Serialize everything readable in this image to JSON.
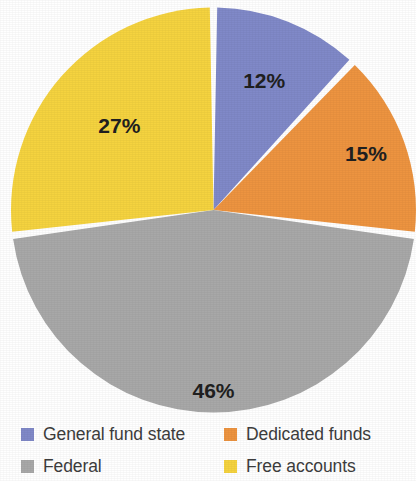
{
  "chart_data": {
    "type": "pie",
    "title": "",
    "subtitle": "",
    "xlabel": "",
    "ylabel": "",
    "legend_position": "bottom",
    "grid": false,
    "start_angle_deg": 0,
    "direction": "clockwise",
    "categories": [
      "General fund state",
      "Dedicated funds",
      "Federal",
      "Free accounts"
    ],
    "values": [
      12,
      15,
      46,
      27
    ],
    "value_unit": "%",
    "data_labels": [
      "12%",
      "15%",
      "46%",
      "27%"
    ],
    "colors": [
      "#8089c8",
      "#ed9440",
      "#a8a8a8",
      "#f5d33f"
    ],
    "slices": [
      {
        "label": "General fund state",
        "value": 12,
        "data_label": "12%",
        "color": "#8089c8",
        "start_deg": 0.0,
        "end_deg": 43.2
      },
      {
        "label": "Dedicated funds",
        "value": 15,
        "data_label": "15%",
        "color": "#ed9440",
        "start_deg": 43.2,
        "end_deg": 97.2
      },
      {
        "label": "Federal",
        "value": 46,
        "data_label": "46%",
        "color": "#a8a8a8",
        "start_deg": 97.2,
        "end_deg": 262.8
      },
      {
        "label": "Free accounts",
        "value": 27,
        "data_label": "27%",
        "color": "#f5d33f",
        "start_deg": 262.8,
        "end_deg": 360.0
      }
    ]
  },
  "legend": {
    "items": [
      {
        "label": "General fund state",
        "color": "#8089c8",
        "swatch_name": "legend-swatch-general-fund-state"
      },
      {
        "label": "Dedicated funds",
        "color": "#ed9440",
        "swatch_name": "legend-swatch-dedicated-funds"
      },
      {
        "label": "Federal",
        "color": "#a8a8a8",
        "swatch_name": "legend-swatch-federal"
      },
      {
        "label": "Free accounts",
        "color": "#f5d33f",
        "swatch_name": "legend-swatch-free-accounts"
      }
    ]
  },
  "style": {
    "background": "#ffffff",
    "label_text_color": "#202020",
    "legend_text_color": "#3d3d3d",
    "slice_separator_color": "#ffffff"
  }
}
